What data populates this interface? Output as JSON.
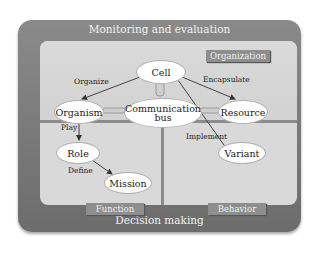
{
  "outer": {
    "top_label": "Monitoring and evaluation",
    "bottom_label": "Decision making"
  },
  "sections": {
    "organization": "Organization",
    "function": "Function",
    "behavior": "Behavior"
  },
  "nodes": {
    "cell": "Cell",
    "organism": "Organism",
    "comm1": "Communication",
    "comm2": "bus",
    "resource": "Resource",
    "role": "Role",
    "mission": "Mission",
    "variant": "Variant"
  },
  "edges": {
    "organize": "Organize",
    "encapsulate": "Encapsulate",
    "play": "Play",
    "define": "Define",
    "implement": "Implement"
  }
}
